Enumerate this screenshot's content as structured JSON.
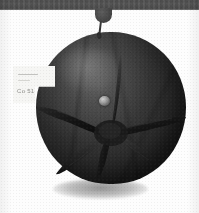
{
  "image": {
    "title": "Dark spherical fruit specimen suspended from mounting bar",
    "medium": "monochrome photograph",
    "background_color": "#fdfdfd",
    "width_px": 199,
    "height_px": 213
  },
  "mount": {
    "bar_name": "mounting bar",
    "bar_color": "#4f4f4f",
    "knob_name": "mount knob",
    "knob_color": "#474747",
    "stem_name": "hanging stem",
    "stem_color": "#2d2d2d"
  },
  "subject": {
    "name": "dark round fruit",
    "description": "persimmon-like sphere with star-shaped calyx",
    "body_color": "#2d2d2d",
    "shadow_color": "#8f8f8f",
    "center_scar_color": "#9a9a9a",
    "calyx": {
      "name": "star calyx",
      "color": "#1a1a1a",
      "arm_count": 6,
      "arms": [
        {
          "label": "arm-west",
          "angle_deg": 186,
          "length": 72
        },
        {
          "label": "arm-southwest",
          "angle_deg": 228,
          "length": 64
        },
        {
          "label": "arm-south",
          "angle_deg": 272,
          "length": 52
        },
        {
          "label": "arm-southeast",
          "angle_deg": 318,
          "length": 60
        },
        {
          "label": "arm-east",
          "angle_deg": 12,
          "length": 76
        },
        {
          "label": "arm-north",
          "angle_deg": 95,
          "length": 66
        }
      ]
    }
  },
  "label": {
    "name": "specimen label",
    "paper_color": "#f6f6f4",
    "code_text": "Co 51",
    "line_text_1": "",
    "line_text_2": ""
  }
}
